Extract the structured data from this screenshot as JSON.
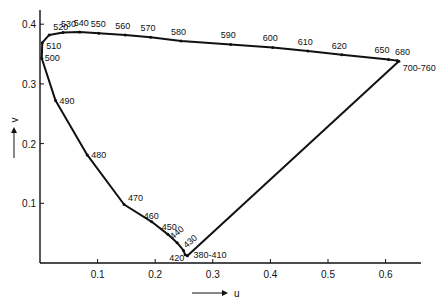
{
  "chart_data": {
    "type": "diagram",
    "title": "",
    "xlabel": "u",
    "ylabel": "v",
    "xlim": [
      0,
      0.66
    ],
    "ylim": [
      0,
      0.41
    ],
    "x_ticks": [
      "0.1",
      "0.2",
      "0.3",
      "0.4",
      "0.5",
      "0.6"
    ],
    "y_ticks": [
      "0.1",
      "0.2",
      "0.3",
      "0.4"
    ],
    "spectral_locus": [
      {
        "label": "380-410",
        "u": 0.256,
        "v": 0.012
      },
      {
        "label": "420",
        "u": 0.252,
        "v": 0.014
      },
      {
        "label": "430",
        "u": 0.249,
        "v": 0.021
      },
      {
        "label": "440",
        "u": 0.238,
        "v": 0.034
      },
      {
        "label": "450",
        "u": 0.222,
        "v": 0.048
      },
      {
        "label": "460",
        "u": 0.194,
        "v": 0.069
      },
      {
        "label": "470",
        "u": 0.146,
        "v": 0.098
      },
      {
        "label": "480",
        "u": 0.082,
        "v": 0.181
      },
      {
        "label": "490",
        "u": 0.027,
        "v": 0.272
      },
      {
        "label": "500",
        "u": 0.003,
        "v": 0.343
      },
      {
        "label": "510",
        "u": 0.004,
        "v": 0.369
      },
      {
        "label": "520",
        "u": 0.016,
        "v": 0.382
      },
      {
        "label": "530",
        "u": 0.04,
        "v": 0.386
      },
      {
        "label": "540",
        "u": 0.069,
        "v": 0.387
      },
      {
        "label": "550",
        "u": 0.102,
        "v": 0.385
      },
      {
        "label": "560",
        "u": 0.148,
        "v": 0.382
      },
      {
        "label": "570",
        "u": 0.192,
        "v": 0.378
      },
      {
        "label": "580",
        "u": 0.245,
        "v": 0.372
      },
      {
        "label": "590",
        "u": 0.331,
        "v": 0.366
      },
      {
        "label": "600",
        "u": 0.404,
        "v": 0.361
      },
      {
        "label": "610",
        "u": 0.465,
        "v": 0.355
      },
      {
        "label": "620",
        "u": 0.524,
        "v": 0.349
      },
      {
        "label": "650",
        "u": 0.605,
        "v": 0.341
      },
      {
        "label": "680",
        "u": 0.62,
        "v": 0.339
      },
      {
        "label": "700-760",
        "u": 0.623,
        "v": 0.338
      }
    ]
  }
}
